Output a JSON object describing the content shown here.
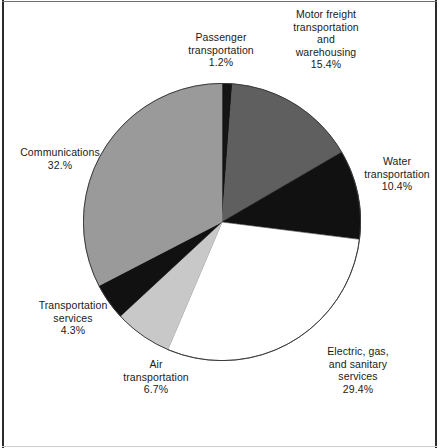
{
  "figure": {
    "background_color": "#ffffff",
    "frame_color": "#2b2b2b"
  },
  "chart_data": {
    "type": "pie",
    "title": "",
    "subtitle": "",
    "xlabel": "",
    "ylabel": "",
    "legend_position": "none",
    "grid": false,
    "units": "percent",
    "start_angle_deg": 0,
    "direction": "clockwise",
    "labels": [
      "Passenger transportation",
      "Motor freight transportation and warehousing",
      "Water transportation",
      "Electric, gas, and sanitary services",
      "Air transportation",
      "Transportation services",
      "Communications"
    ],
    "values": [
      1.2,
      15.4,
      10.4,
      29.4,
      6.7,
      4.3,
      32.0
    ],
    "value_texts": [
      "1.2%",
      "15.4%",
      "10.4%",
      "29.4%",
      "6.7%",
      "4.3%",
      "32.%"
    ],
    "colors": [
      "#151515",
      "#5f5f5f",
      "#111111",
      "#ffffff",
      "#c8c8c8",
      "#111111",
      "#9a9a9a"
    ],
    "slices": [
      {
        "name": "passenger-transportation",
        "label": "Passenger transportation",
        "value": 1.2,
        "value_text": "1.2%",
        "color": "#151515",
        "start_deg": 0,
        "end_deg": 4.32
      },
      {
        "name": "motor-freight-transportation-and-warehousing",
        "label": "Motor freight transportation and warehousing",
        "value": 15.4,
        "value_text": "15.4%",
        "color": "#5f5f5f",
        "start_deg": 4.32,
        "end_deg": 59.76
      },
      {
        "name": "water-transportation",
        "label": "Water transportation",
        "value": 10.4,
        "value_text": "10.4%",
        "color": "#111111",
        "start_deg": 59.76,
        "end_deg": 97.2
      },
      {
        "name": "electric-gas-and-sanitary-services",
        "label": "Electric, gas, and sanitary services",
        "value": 29.4,
        "value_text": "29.4%",
        "color": "#ffffff",
        "start_deg": 97.2,
        "end_deg": 203.04
      },
      {
        "name": "air-transportation",
        "label": "Air transportation",
        "value": 6.7,
        "value_text": "6.7%",
        "color": "#c8c8c8",
        "start_deg": 203.04,
        "end_deg": 227.16
      },
      {
        "name": "transportation-services",
        "label": "Transportation services",
        "value": 4.3,
        "value_text": "4.3%",
        "color": "#111111",
        "start_deg": 227.16,
        "end_deg": 242.64
      },
      {
        "name": "communications",
        "label": "Communications",
        "value": 32.0,
        "value_text": "32.%",
        "color": "#9a9a9a",
        "start_deg": 242.64,
        "end_deg": 360
      }
    ]
  },
  "labels": {
    "motor_freight": {
      "line1": "Motor freight",
      "line2": "transportation",
      "line3": "and",
      "line4": "warehousing",
      "pct": "15.4%",
      "text": "Motor freight\ntransportation\nand\nwarehousing\n15.4%"
    },
    "passenger": {
      "line1": "Passenger",
      "line2": "transportation",
      "pct": "1.2%",
      "text": "Passenger\ntransportation\n1.2%"
    },
    "water": {
      "line1": "Water",
      "line2": "transportation",
      "pct": "10.4%",
      "text": "Water\ntransportation\n10.4%"
    },
    "communications": {
      "line1": "Communications",
      "pct": "32.%",
      "text": "Communications\n32.%"
    },
    "electric": {
      "line1": "Electric, gas,",
      "line2": "and sanitary",
      "line3": "services",
      "pct": "29.4%",
      "text": "Electric, gas,\nand sanitary\nservices\n29.4%"
    },
    "air": {
      "line1": "Air",
      "line2": "transportation",
      "pct": "6.7%",
      "text": "Air\ntransportation\n6.7%"
    },
    "transportation_services": {
      "line1": "Transportation",
      "line2": "services",
      "pct": "4.3%",
      "text": "Transportation\nservices\n4.3%"
    }
  }
}
